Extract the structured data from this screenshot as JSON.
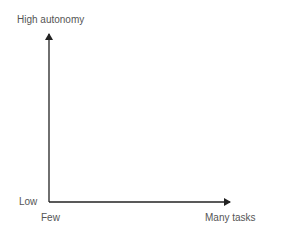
{
  "diagram": {
    "y_axis": {
      "top_label": "High autonomy",
      "bottom_label": "Low"
    },
    "x_axis": {
      "left_label": "Few",
      "right_label": "Many tasks"
    },
    "axis_color": "#222222",
    "text_color": "#555555"
  }
}
